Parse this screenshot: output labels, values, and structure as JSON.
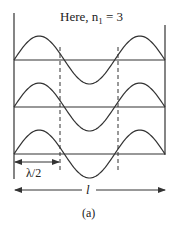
{
  "title_main": "Here, n",
  "title_sub": "1",
  "title_tail": " = 3",
  "lambda_label": "λ/2",
  "length_label": "l",
  "caption": "(a)",
  "colors": {
    "stroke": "#333333",
    "text": "#222222"
  },
  "rows": 3,
  "nodes_per_row": 4,
  "wave_loops": 3
}
